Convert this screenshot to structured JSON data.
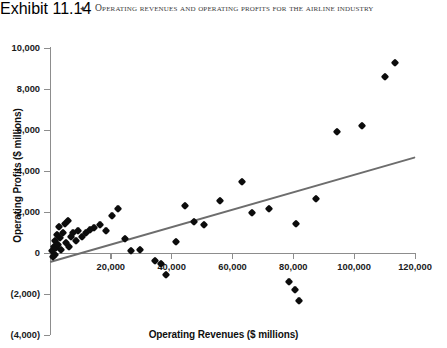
{
  "exhibit": {
    "number": "Exhibit 11.14",
    "bullet": "✦",
    "title": "Operating Revenues and Operating Profits for the Airline Industry"
  },
  "chart_data": {
    "type": "scatter",
    "title": "Operating Revenues and Operating Profits for the Airline Industry",
    "xlabel": "Operating Revenues ($ millions)",
    "ylabel": "Operating Profits ($ millions)",
    "xlim": [
      0,
      120000
    ],
    "ylim": [
      -4000,
      10000
    ],
    "xticks": [
      0,
      20000,
      40000,
      60000,
      80000,
      100000,
      120000
    ],
    "xticklabels": [
      "",
      "20,000",
      "40,000",
      "60,000",
      "80,000",
      "100,000",
      "120,000"
    ],
    "yticks": [
      10000,
      8000,
      6000,
      4000,
      2000,
      0,
      -2000,
      -4000
    ],
    "yticklabels": [
      "10,000",
      "8,000",
      "6,000",
      "4,000",
      "2,000",
      "0",
      "(2,000)",
      "(4,000)"
    ],
    "grid": false,
    "legend": null,
    "marker": "diamond",
    "marker_color": "#0c0c0c",
    "trendline": {
      "color": "#6d6d6d",
      "x": [
        0,
        120000
      ],
      "y": [
        -450,
        4650
      ]
    },
    "points": [
      {
        "x": 500,
        "y": 100
      },
      {
        "x": 900,
        "y": -200
      },
      {
        "x": 1200,
        "y": 300
      },
      {
        "x": 1500,
        "y": -100
      },
      {
        "x": 1800,
        "y": 600
      },
      {
        "x": 2100,
        "y": 250
      },
      {
        "x": 2400,
        "y": 900
      },
      {
        "x": 2700,
        "y": 400
      },
      {
        "x": 3000,
        "y": 1250
      },
      {
        "x": 3300,
        "y": 750
      },
      {
        "x": 3600,
        "y": 150
      },
      {
        "x": 4200,
        "y": 1000
      },
      {
        "x": 4800,
        "y": 1400
      },
      {
        "x": 5200,
        "y": 500
      },
      {
        "x": 5800,
        "y": 1550
      },
      {
        "x": 6400,
        "y": 300
      },
      {
        "x": 7000,
        "y": 800
      },
      {
        "x": 7600,
        "y": 1000
      },
      {
        "x": 8400,
        "y": 600
      },
      {
        "x": 9200,
        "y": 1050
      },
      {
        "x": 10500,
        "y": 800
      },
      {
        "x": 11800,
        "y": 1000
      },
      {
        "x": 13000,
        "y": 1100
      },
      {
        "x": 14500,
        "y": 1200
      },
      {
        "x": 16500,
        "y": 1350
      },
      {
        "x": 18500,
        "y": 1050
      },
      {
        "x": 20500,
        "y": 1800
      },
      {
        "x": 22500,
        "y": 2150
      },
      {
        "x": 24500,
        "y": 700
      },
      {
        "x": 26500,
        "y": 100
      },
      {
        "x": 29500,
        "y": 150
      },
      {
        "x": 34500,
        "y": -400
      },
      {
        "x": 36500,
        "y": -550
      },
      {
        "x": 38000,
        "y": -1050
      },
      {
        "x": 41500,
        "y": 550
      },
      {
        "x": 44500,
        "y": 2300
      },
      {
        "x": 47500,
        "y": 1500
      },
      {
        "x": 50500,
        "y": 1350
      },
      {
        "x": 56000,
        "y": 2550
      },
      {
        "x": 63000,
        "y": 3450
      },
      {
        "x": 66500,
        "y": 1950
      },
      {
        "x": 72000,
        "y": 2150
      },
      {
        "x": 78500,
        "y": -1400
      },
      {
        "x": 80500,
        "y": -1800
      },
      {
        "x": 82000,
        "y": -2350
      },
      {
        "x": 81000,
        "y": 1400
      },
      {
        "x": 87500,
        "y": 2650
      },
      {
        "x": 94500,
        "y": 5900
      },
      {
        "x": 102500,
        "y": 6200
      },
      {
        "x": 110000,
        "y": 8600
      },
      {
        "x": 113500,
        "y": 9250
      }
    ]
  }
}
